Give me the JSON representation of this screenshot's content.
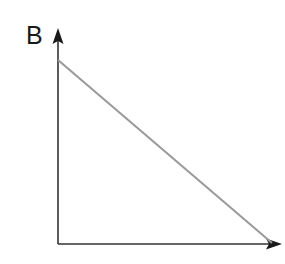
{
  "figure": {
    "background_color": "#ffffff",
    "width": 285,
    "height": 264
  },
  "labels": {
    "y_axis": "B",
    "x_axis": ""
  },
  "colors": {
    "axis": "#333333",
    "line": "#999999",
    "label_text": "#1a1a1a",
    "background": "#ffffff"
  },
  "chart_data": {
    "type": "line",
    "title": "",
    "xlabel": "",
    "ylabel": "B",
    "grid": false,
    "legend": null,
    "xlim": [
      0,
      1
    ],
    "ylim": [
      0,
      1
    ],
    "axis_style": "arrow-headed L-shaped axes, no tick marks, no tick labels",
    "series": [
      {
        "name": "budget-line",
        "color": "#999999",
        "linewidth": 2,
        "x": [
          0,
          1
        ],
        "y": [
          1,
          0
        ],
        "description": "straight downward-sloping line from the top of the vertical axis to the right end of the horizontal axis"
      }
    ],
    "pixel_geometry": {
      "origin": [
        58,
        244
      ],
      "y_axis_top": [
        58,
        32
      ],
      "x_axis_right": [
        282,
        244
      ],
      "line_start": [
        58,
        60
      ],
      "line_end": [
        272,
        243
      ]
    }
  }
}
